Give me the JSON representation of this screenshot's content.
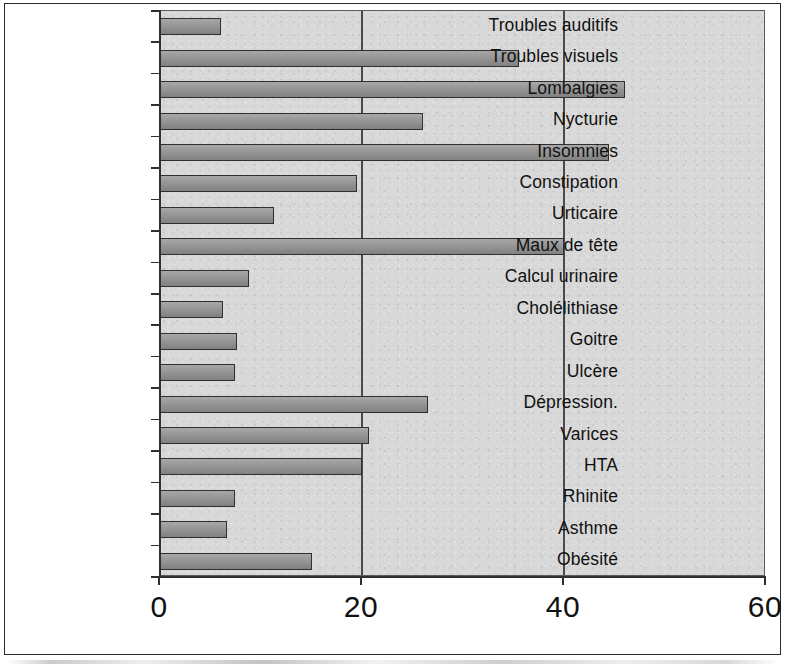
{
  "chart_data": {
    "type": "bar",
    "orientation": "horizontal",
    "title": "",
    "subtitle": "",
    "xlabel": "",
    "ylabel": "",
    "xlim": [
      0,
      60
    ],
    "xticks": [
      0,
      20,
      40,
      60
    ],
    "xtick_labels": [
      "0",
      "20",
      "40",
      "60"
    ],
    "grid": "vertical",
    "legend": "none",
    "plot_background": "#d8d8d8",
    "bar_fill": "#8f8f8f",
    "bar_edge": "#303030",
    "categories": [
      "Troubles auditifs",
      "Troubles visuels",
      "Lombalgies",
      "Nycturie",
      "Insomnies",
      "Constipation",
      "Urticaire",
      "Maux de tête",
      "Calcul urinaire",
      "Cholélithiase",
      "Goitre",
      "Ulcère",
      "Dépression.",
      "Varices",
      "HTA",
      "Rhinite",
      "Asthme",
      "Obésité"
    ],
    "values": [
      6,
      35.5,
      46,
      26,
      44.5,
      19.5,
      11.3,
      40,
      8.8,
      6.2,
      7.6,
      7.4,
      26.5,
      20.7,
      20,
      7.4,
      6.6,
      15
    ]
  }
}
